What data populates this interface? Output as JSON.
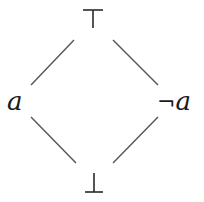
{
  "diagram": {
    "type": "hasse-diagram",
    "nodes": {
      "top": {
        "label": "⊤"
      },
      "left": {
        "label": "a"
      },
      "right": {
        "negation": "¬",
        "label": "a"
      },
      "bottom": {
        "label": "⊥"
      }
    },
    "edges": [
      {
        "from": "left",
        "to": "top"
      },
      {
        "from": "right",
        "to": "top"
      },
      {
        "from": "bottom",
        "to": "left"
      },
      {
        "from": "bottom",
        "to": "right"
      }
    ],
    "colors": {
      "line": "#555555",
      "text": "#1a1a1a",
      "background": "#ffffff"
    }
  }
}
